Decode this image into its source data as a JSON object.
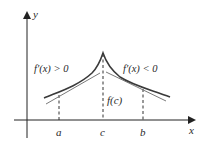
{
  "diagram": {
    "type": "function-graph",
    "axes": {
      "x_label": "x",
      "y_label": "y"
    },
    "points": {
      "a_label": "a",
      "c_label": "c",
      "b_label": "b"
    },
    "annotations": {
      "left_region": "f′(x) > 0",
      "right_region": "f′(x) < 0",
      "max_value": "f(c)"
    },
    "colors": {
      "curve": "#3a3a3a",
      "tangent": "#7a7a7a",
      "axes": "#222222",
      "dashed": "#333333"
    }
  }
}
